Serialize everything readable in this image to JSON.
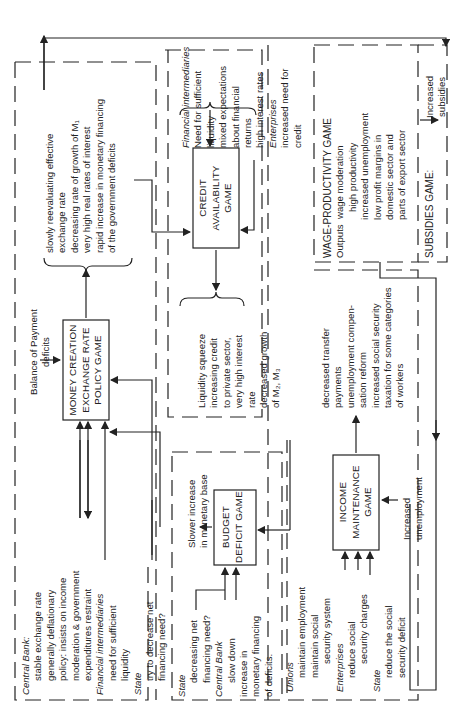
{
  "orientation": "rotated 90 degrees counter-clockwise",
  "games": {
    "money_creation": {
      "title_lines": [
        "MONEY CREATION",
        "EXCHANGE RATE",
        "POLICY GAME"
      ]
    },
    "credit_availability": {
      "title_lines": [
        "CREDIT",
        "AVAILABILITY",
        "GAME"
      ]
    },
    "budget_deficit": {
      "title_lines": [
        "BUDGET",
        "DEFICIT GAME"
      ]
    },
    "income_maintenance": {
      "title_lines": [
        "INCOME",
        "MAINTENANCE",
        "GAME"
      ]
    },
    "wage_productivity": {
      "title": "WAGE-PRODUCTIVITY GAME"
    },
    "subsidies": {
      "title": "SUBSIDIES GAME:"
    }
  },
  "money_creation_inputs": {
    "central_bank_label": "Central Bank:",
    "central_bank_lines": [
      "stable exchange rate",
      "generally deflationary",
      "policy: insists on income",
      "moderation &  government",
      "expenditures  restraint"
    ],
    "fin_int_label": "Financial intermediaries",
    "fin_int_lines": [
      "need for sufficient",
      "liquidity"
    ],
    "state_label": "State",
    "state_lines": [
      "try to decrease net",
      "financing need?"
    ],
    "bop_lines": [
      "Balance of Payment",
      "deficits"
    ]
  },
  "money_creation_outputs": {
    "lines": [
      "slowly reevaluating effective",
      "exchange rate",
      "decreasing rate of growth of M₁",
      "very high real rates of interest",
      "rapid increase in monetary financing",
      "of the government deficits"
    ]
  },
  "credit_inputs": {
    "fin_int_label": "Financial intermediaries",
    "fin_int_lines": [
      "Need for sufficient",
      "liquidity",
      "mixed expectations",
      "about financial",
      "returns",
      "high interest rates"
    ],
    "enterprises_label": "Enterprises",
    "enterprises_lines": [
      "increased need for",
      "credit"
    ]
  },
  "credit_outputs": {
    "lines": [
      "Liquidity squeeze",
      "increasing credit",
      "to private sector,",
      "very high interest",
      "rate",
      "decreased growth",
      "of M₂, M₃"
    ]
  },
  "budget_inputs": {
    "state_label": "State",
    "state_lines": [
      "decreasing net",
      "financing need?"
    ],
    "central_bank_label": "Central Bank",
    "central_bank_lines": [
      "slow down",
      "increase in",
      "monetary financing",
      "of deficits."
    ]
  },
  "budget_outputs": {
    "lines": [
      "Slower increase",
      "in monetary base"
    ]
  },
  "income_inputs": {
    "unions_label": "Unions",
    "unions_lines": [
      "maintain employment",
      "maintain social",
      "security system"
    ],
    "enterprises_label": "Enterprises",
    "enterprises_lines": [
      "reduce social",
      "security charges"
    ],
    "state_label": "State",
    "state_lines": [
      "reduce the social",
      "security deficit"
    ],
    "unemployment_lines": [
      "Increased",
      "unemployment"
    ]
  },
  "income_outputs": {
    "lines": [
      "decreased transfer",
      "payments",
      "unemployment compen-",
      "sation reform",
      "increased social security",
      "taxation for some categories",
      "of workers"
    ]
  },
  "wage_outputs": {
    "label": "Outputs",
    "lines": [
      "wage moderation",
      "high productivity",
      "increased unemployment",
      "low profit margins in",
      "domestic sector and",
      "parts of export sector"
    ]
  },
  "subsidies_outputs": {
    "lines": [
      "Increased",
      "subsidies"
    ]
  }
}
